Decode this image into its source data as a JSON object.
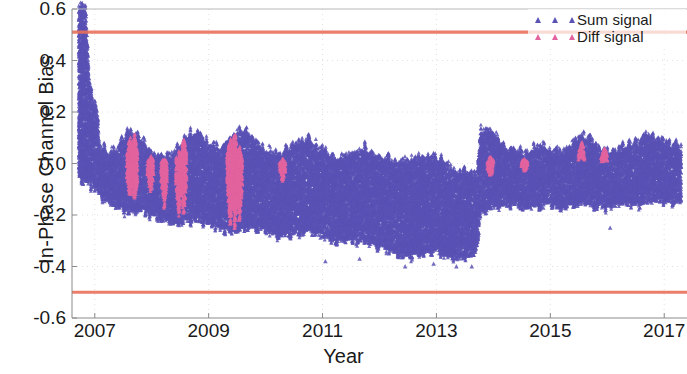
{
  "chart_data": {
    "type": "scatter",
    "title": "",
    "xlabel": "Year",
    "ylabel": "In-Phase Channel Bias",
    "xlim": [
      2006.6,
      2017.4
    ],
    "ylim": [
      -0.6,
      0.6
    ],
    "xticks": [
      2007,
      2009,
      2011,
      2013,
      2015,
      2017
    ],
    "xtick_labels": [
      "2007",
      "2009",
      "2011",
      "2013",
      "2015",
      "2017"
    ],
    "yticks": [
      -0.6,
      -0.4,
      -0.2,
      0.0,
      0.2,
      0.4,
      0.6
    ],
    "ytick_labels": [
      "-0.6",
      "-0.4",
      "-0.2",
      "0.0",
      "0.2",
      "0.4",
      "0.6"
    ],
    "grid": true,
    "legend_position": "top-right",
    "marker": "triangle",
    "series": [
      {
        "name": "Sum signal",
        "color": "#5a52b5",
        "marker": "triangle",
        "envelope": [
          {
            "x": 2006.72,
            "lo": -0.03,
            "hi": 0.6
          },
          {
            "x": 2006.78,
            "lo": -0.05,
            "hi": 0.6
          },
          {
            "x": 2006.84,
            "lo": -0.06,
            "hi": 0.59
          },
          {
            "x": 2006.9,
            "lo": -0.07,
            "hi": 0.33
          },
          {
            "x": 2006.96,
            "lo": -0.08,
            "hi": 0.24
          },
          {
            "x": 2007.02,
            "lo": -0.09,
            "hi": 0.22
          },
          {
            "x": 2007.1,
            "lo": -0.12,
            "hi": 0.05
          },
          {
            "x": 2007.25,
            "lo": -0.14,
            "hi": 0.03
          },
          {
            "x": 2007.4,
            "lo": -0.16,
            "hi": 0.04
          },
          {
            "x": 2007.55,
            "lo": -0.17,
            "hi": 0.1
          },
          {
            "x": 2007.7,
            "lo": -0.18,
            "hi": 0.11
          },
          {
            "x": 2007.85,
            "lo": -0.17,
            "hi": 0.07
          },
          {
            "x": 2008.0,
            "lo": -0.19,
            "hi": 0.02
          },
          {
            "x": 2008.2,
            "lo": -0.21,
            "hi": 0.01
          },
          {
            "x": 2008.4,
            "lo": -0.22,
            "hi": 0.03
          },
          {
            "x": 2008.6,
            "lo": -0.21,
            "hi": 0.09
          },
          {
            "x": 2008.8,
            "lo": -0.2,
            "hi": 0.11
          },
          {
            "x": 2009.0,
            "lo": -0.22,
            "hi": 0.06
          },
          {
            "x": 2009.2,
            "lo": -0.24,
            "hi": 0.04
          },
          {
            "x": 2009.4,
            "lo": -0.25,
            "hi": 0.1
          },
          {
            "x": 2009.6,
            "lo": -0.24,
            "hi": 0.12
          },
          {
            "x": 2009.8,
            "lo": -0.23,
            "hi": 0.08
          },
          {
            "x": 2010.0,
            "lo": -0.25,
            "hi": 0.03
          },
          {
            "x": 2010.25,
            "lo": -0.27,
            "hi": 0.02
          },
          {
            "x": 2010.5,
            "lo": -0.26,
            "hi": 0.06
          },
          {
            "x": 2010.75,
            "lo": -0.25,
            "hi": 0.08
          },
          {
            "x": 2011.0,
            "lo": -0.27,
            "hi": 0.04
          },
          {
            "x": 2011.25,
            "lo": -0.29,
            "hi": 0.0
          },
          {
            "x": 2011.5,
            "lo": -0.28,
            "hi": 0.03
          },
          {
            "x": 2011.75,
            "lo": -0.29,
            "hi": 0.05
          },
          {
            "x": 2012.0,
            "lo": -0.31,
            "hi": 0.02
          },
          {
            "x": 2012.25,
            "lo": -0.33,
            "hi": -0.01
          },
          {
            "x": 2012.5,
            "lo": -0.35,
            "hi": 0.0
          },
          {
            "x": 2012.75,
            "lo": -0.34,
            "hi": 0.02
          },
          {
            "x": 2013.0,
            "lo": -0.33,
            "hi": 0.01
          },
          {
            "x": 2013.2,
            "lo": -0.35,
            "hi": -0.02
          },
          {
            "x": 2013.4,
            "lo": -0.36,
            "hi": -0.04
          },
          {
            "x": 2013.55,
            "lo": -0.35,
            "hi": -0.05
          },
          {
            "x": 2013.7,
            "lo": -0.33,
            "hi": -0.06
          },
          {
            "x": 2013.78,
            "lo": -0.18,
            "hi": 0.11
          },
          {
            "x": 2013.9,
            "lo": -0.16,
            "hi": 0.13
          },
          {
            "x": 2014.05,
            "lo": -0.15,
            "hi": 0.09
          },
          {
            "x": 2014.2,
            "lo": -0.14,
            "hi": 0.05
          },
          {
            "x": 2014.4,
            "lo": -0.15,
            "hi": 0.04
          },
          {
            "x": 2014.6,
            "lo": -0.16,
            "hi": 0.03
          },
          {
            "x": 2014.8,
            "lo": -0.15,
            "hi": 0.05
          },
          {
            "x": 2015.0,
            "lo": -0.14,
            "hi": 0.04
          },
          {
            "x": 2015.2,
            "lo": -0.16,
            "hi": 0.03
          },
          {
            "x": 2015.4,
            "lo": -0.15,
            "hi": 0.06
          },
          {
            "x": 2015.55,
            "lo": -0.14,
            "hi": 0.1
          },
          {
            "x": 2015.7,
            "lo": -0.15,
            "hi": 0.08
          },
          {
            "x": 2015.9,
            "lo": -0.16,
            "hi": 0.04
          },
          {
            "x": 2016.1,
            "lo": -0.15,
            "hi": 0.03
          },
          {
            "x": 2016.3,
            "lo": -0.14,
            "hi": 0.05
          },
          {
            "x": 2016.5,
            "lo": -0.15,
            "hi": 0.07
          },
          {
            "x": 2016.7,
            "lo": -0.14,
            "hi": 0.1
          },
          {
            "x": 2016.9,
            "lo": -0.13,
            "hi": 0.08
          },
          {
            "x": 2017.1,
            "lo": -0.14,
            "hi": 0.06
          },
          {
            "x": 2017.3,
            "lo": -0.13,
            "hi": 0.05
          }
        ],
        "outliers": [
          {
            "x": 2011.05,
            "y": -0.38
          },
          {
            "x": 2011.65,
            "y": -0.37
          },
          {
            "x": 2012.45,
            "y": -0.4
          },
          {
            "x": 2012.95,
            "y": -0.39
          },
          {
            "x": 2013.35,
            "y": -0.4
          },
          {
            "x": 2013.62,
            "y": -0.4
          },
          {
            "x": 2016.05,
            "y": -0.25
          }
        ]
      },
      {
        "name": "Diff signal",
        "color": "#e2649e",
        "marker": "triangle",
        "bursts": [
          {
            "x": 2007.62,
            "lo": -0.13,
            "hi": 0.1
          },
          {
            "x": 2007.7,
            "lo": -0.14,
            "hi": 0.11
          },
          {
            "x": 2007.98,
            "lo": -0.11,
            "hi": 0.02
          },
          {
            "x": 2008.22,
            "lo": -0.17,
            "hi": 0.01
          },
          {
            "x": 2008.48,
            "lo": -0.2,
            "hi": 0.04
          },
          {
            "x": 2008.56,
            "lo": -0.19,
            "hi": 0.09
          },
          {
            "x": 2009.38,
            "lo": -0.24,
            "hi": 0.1
          },
          {
            "x": 2009.46,
            "lo": -0.25,
            "hi": 0.12
          },
          {
            "x": 2009.54,
            "lo": -0.22,
            "hi": 0.06
          },
          {
            "x": 2010.3,
            "lo": -0.06,
            "hi": 0.01
          },
          {
            "x": 2013.95,
            "lo": -0.04,
            "hi": 0.02
          },
          {
            "x": 2014.55,
            "lo": -0.02,
            "hi": 0.01
          },
          {
            "x": 2015.55,
            "lo": 0.04,
            "hi": 0.09
          },
          {
            "x": 2015.95,
            "lo": 0.02,
            "hi": 0.06
          }
        ]
      }
    ],
    "reference_lines": [
      {
        "name": "upper-threshold",
        "y": 0.51,
        "color": "#e8705a"
      },
      {
        "name": "lower-threshold",
        "y": -0.5,
        "color": "#e8705a"
      }
    ]
  },
  "legend": {
    "items": [
      {
        "label": "Sum signal",
        "color": "#5a52b5"
      },
      {
        "label": "Diff signal",
        "color": "#e2649e"
      }
    ]
  }
}
